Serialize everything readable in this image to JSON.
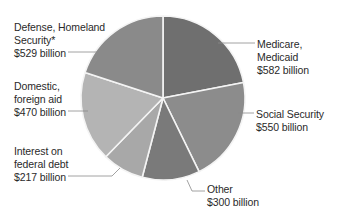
{
  "chart_data": {
    "type": "pie",
    "title": "",
    "unit": "billion USD",
    "start_angle_deg": 0,
    "direction": "clockwise",
    "slices": [
      {
        "name": "Medicare, Medicaid",
        "value": 582,
        "label_lines": [
          "Medicare,",
          "Medicaid",
          "$582 billion"
        ],
        "color": "#6f6f6f"
      },
      {
        "name": "Social Security",
        "value": 550,
        "label_lines": [
          "Social Security",
          "$550 billion"
        ],
        "color": "#8c8c8c"
      },
      {
        "name": "Other",
        "value": 300,
        "label_lines": [
          "Other",
          "$300 billion"
        ],
        "color": "#7a7a7a"
      },
      {
        "name": "Interest on federal debt",
        "value": 217,
        "label_lines": [
          "Interest on",
          "federal debt",
          "$217 billion"
        ],
        "color": "#a8a8a8"
      },
      {
        "name": "Domestic, foreign aid",
        "value": 470,
        "label_lines": [
          "Domestic,",
          "foreign aid",
          "$470 billion"
        ],
        "color": "#b4b4b4"
      },
      {
        "name": "Defense, Homeland Security*",
        "value": 529,
        "label_lines": [
          "Defense, Homeland",
          "Security*",
          "$529 billion"
        ],
        "color": "#8a8a8a"
      }
    ],
    "legend": "none (callout labels)"
  }
}
